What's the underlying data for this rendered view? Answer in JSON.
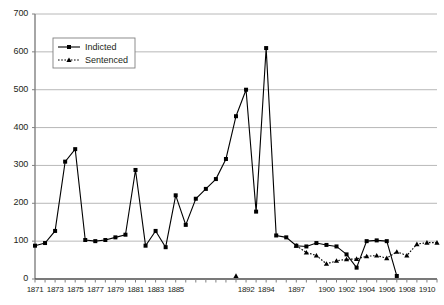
{
  "chart_data": {
    "type": "line",
    "title": "",
    "subtitle": "",
    "xlabel": "",
    "ylabel": "",
    "ylim": [
      0,
      700
    ],
    "ytick_step": 100,
    "yticks": [
      0,
      100,
      200,
      300,
      400,
      500,
      600,
      700
    ],
    "grid": true,
    "grid_axis": "y",
    "legend_position": "top-left",
    "legend": [
      "Indicted",
      "Sentenced"
    ],
    "x": [
      1871,
      1872,
      1873,
      1874,
      1875,
      1876,
      1877,
      1878,
      1879,
      1880,
      1881,
      1882,
      1883,
      1884,
      1885,
      1886,
      1887,
      1888,
      1889,
      1890,
      1891,
      1892,
      1893,
      1894,
      1895,
      1896,
      1897,
      1898,
      1899,
      1900,
      1901,
      1902,
      1903,
      1904,
      1905,
      1906,
      1907,
      1908,
      1909,
      1910,
      1911
    ],
    "xtick_labels": [
      "1871",
      "",
      "1873",
      "",
      "1875",
      "",
      "1877",
      "",
      "1879",
      "",
      "1881",
      "",
      "1883",
      "",
      "1885",
      "",
      "",
      "",
      "",
      "",
      "",
      "1892",
      "",
      "1894",
      "",
      "",
      "1897",
      "",
      "",
      "1900",
      "",
      "1902",
      "",
      "1904",
      "",
      "1906",
      "",
      "1908",
      "",
      "1910",
      ""
    ],
    "xtick_labels_shown": [
      "1871",
      "1873",
      "1875",
      "1877",
      "1879",
      "1881",
      "1883",
      "1885",
      "1892",
      "1894",
      "1897",
      "1900",
      "1902",
      "1904",
      "1906",
      "1908",
      "1910"
    ],
    "series": [
      {
        "name": "Indicted",
        "marker": "square",
        "linestyle": "solid",
        "color": "#000000",
        "values": [
          88,
          95,
          127,
          310,
          343,
          103,
          100,
          103,
          110,
          117,
          288,
          88,
          127,
          84,
          221,
          143,
          212,
          238,
          264,
          317,
          430,
          500,
          178,
          610,
          115,
          110,
          88,
          86,
          95,
          90,
          86,
          65,
          30,
          100,
          102,
          100,
          8,
          null,
          null,
          null,
          null
        ]
      },
      {
        "name": "Sentenced",
        "marker": "triangle",
        "linestyle": "dotted",
        "color": "#000000",
        "values": [
          null,
          null,
          null,
          null,
          null,
          null,
          null,
          null,
          null,
          null,
          null,
          null,
          null,
          null,
          null,
          null,
          null,
          null,
          null,
          null,
          8,
          null,
          null,
          null,
          null,
          null,
          88,
          70,
          62,
          40,
          48,
          52,
          53,
          60,
          62,
          55,
          72,
          62,
          92,
          96,
          96
        ]
      }
    ],
    "series_points": {
      "Indicted": [
        {
          "x": 1871,
          "y": 88
        },
        {
          "x": 1872,
          "y": 95
        },
        {
          "x": 1873,
          "y": 127
        },
        {
          "x": 1874,
          "y": 310
        },
        {
          "x": 1875,
          "y": 343
        },
        {
          "x": 1876,
          "y": 103
        },
        {
          "x": 1877,
          "y": 100
        },
        {
          "x": 1878,
          "y": 103
        },
        {
          "x": 1879,
          "y": 110
        },
        {
          "x": 1880,
          "y": 117
        },
        {
          "x": 1881,
          "y": 288
        },
        {
          "x": 1882,
          "y": 88
        },
        {
          "x": 1883,
          "y": 127
        },
        {
          "x": 1884,
          "y": 84
        },
        {
          "x": 1885,
          "y": 221
        },
        {
          "x": 1886,
          "y": 143
        },
        {
          "x": 1887,
          "y": 212
        },
        {
          "x": 1888,
          "y": 238
        },
        {
          "x": 1889,
          "y": 264
        },
        {
          "x": 1890,
          "y": 317
        },
        {
          "x": 1891,
          "y": 430
        },
        {
          "x": 1892,
          "y": 500
        },
        {
          "x": 1893,
          "y": 178
        },
        {
          "x": 1894,
          "y": 610
        },
        {
          "x": 1895,
          "y": 115
        },
        {
          "x": 1896,
          "y": 110
        },
        {
          "x": 1897,
          "y": 88
        },
        {
          "x": 1898,
          "y": 86
        },
        {
          "x": 1899,
          "y": 95
        },
        {
          "x": 1900,
          "y": 90
        },
        {
          "x": 1901,
          "y": 86
        },
        {
          "x": 1902,
          "y": 65
        },
        {
          "x": 1903,
          "y": 30
        },
        {
          "x": 1904,
          "y": 100
        },
        {
          "x": 1905,
          "y": 102
        },
        {
          "x": 1906,
          "y": 100
        },
        {
          "x": 1907,
          "y": 8
        }
      ],
      "Sentenced": [
        {
          "x": 1891,
          "y": 8
        },
        {
          "x": 1897,
          "y": 88
        },
        {
          "x": 1898,
          "y": 70
        },
        {
          "x": 1899,
          "y": 62
        },
        {
          "x": 1900,
          "y": 40
        },
        {
          "x": 1901,
          "y": 48
        },
        {
          "x": 1902,
          "y": 52
        },
        {
          "x": 1903,
          "y": 53
        },
        {
          "x": 1904,
          "y": 60
        },
        {
          "x": 1905,
          "y": 62
        },
        {
          "x": 1906,
          "y": 55
        },
        {
          "x": 1907,
          "y": 72
        },
        {
          "x": 1908,
          "y": 62
        },
        {
          "x": 1909,
          "y": 92
        },
        {
          "x": 1910,
          "y": 96
        },
        {
          "x": 1911,
          "y": 96
        }
      ]
    },
    "colors": {
      "line": "#000000",
      "grid": "#a6a6a6",
      "axis": "#808080",
      "text": "#231f20",
      "background": "#ffffff"
    }
  }
}
